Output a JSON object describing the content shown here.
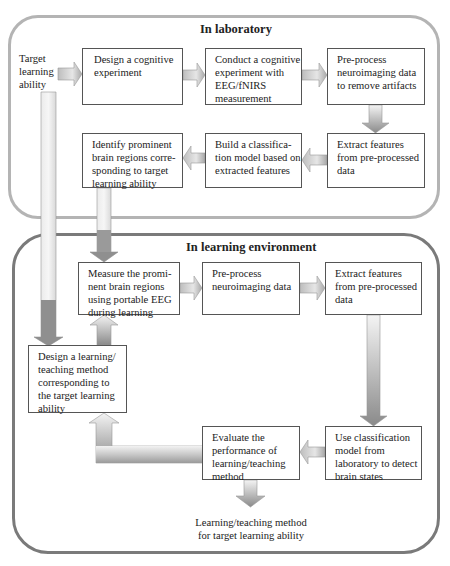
{
  "containers": {
    "laboratory": {
      "title": "In laboratory",
      "border_color": "#b4b4b4"
    },
    "learning_environment": {
      "title": "In learning environment",
      "border_color": "#7a7a7a"
    }
  },
  "start_label": [
    "Target",
    "learning",
    "ability"
  ],
  "laboratory_steps": [
    {
      "id": "design-cognitive-experiment",
      "lines": [
        "Design a cognitive",
        "experiment"
      ]
    },
    {
      "id": "conduct-cognitive-experiment",
      "lines": [
        "Conduct a cognitive",
        "experiment with",
        "EEG/fNIRS",
        "measurement"
      ]
    },
    {
      "id": "preprocess-lab",
      "lines": [
        "Pre-process",
        "neuroimaging data",
        "to remove artifacts"
      ]
    },
    {
      "id": "extract-features-lab",
      "lines": [
        "Extract features",
        "from pre-processed",
        "data"
      ]
    },
    {
      "id": "build-classification-model",
      "lines": [
        "Build a classifica-",
        "tion model based on",
        "extracted features"
      ]
    },
    {
      "id": "identify-brain-regions",
      "lines": [
        "Identify prominent",
        "brain regions corre-",
        "sponding to target",
        "learning ability"
      ]
    }
  ],
  "environment_steps": [
    {
      "id": "measure-brain-regions",
      "lines": [
        "Measure the promi-",
        "nent brain regions",
        "using portable EEG",
        "during learning"
      ]
    },
    {
      "id": "preprocess-env",
      "lines": [
        "Pre-process",
        "neuroimaging data"
      ]
    },
    {
      "id": "extract-features-env",
      "lines": [
        "Extract features",
        "from pre-processed",
        "data"
      ]
    },
    {
      "id": "design-learning-method",
      "lines": [
        "Design a learning/",
        "teaching method",
        "corresponding to",
        "the target learning",
        "ability"
      ]
    },
    {
      "id": "evaluate-performance",
      "lines": [
        "Evaluate the",
        "performance of",
        "learning/teaching",
        "method"
      ]
    },
    {
      "id": "use-classification-model",
      "lines": [
        "Use classification",
        "model from",
        "laboratory to detect",
        "brain states"
      ]
    }
  ],
  "output_label": [
    "Learning/teaching method",
    "for target learning ability"
  ],
  "arrow_colors": {
    "light": "#ececec",
    "dark": "#8a8a8a",
    "outline": "#999999"
  }
}
